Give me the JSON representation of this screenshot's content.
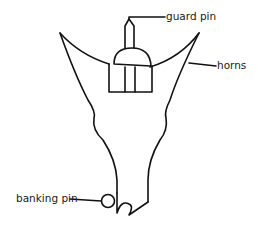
{
  "diagram": {
    "labels": {
      "guard_pin": "guard pin",
      "horns": "horns",
      "banking_pin": "banking pin"
    },
    "colors": {
      "stroke": "#111111",
      "background": "#ffffff",
      "text": "#1a1a1a"
    }
  }
}
